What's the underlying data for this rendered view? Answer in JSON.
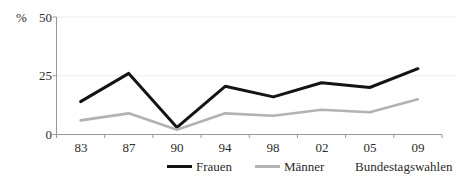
{
  "chart_data": {
    "type": "line",
    "title": "",
    "unit_label": "%",
    "xlabel": "Bundestagswahlen",
    "categories": [
      "83",
      "87",
      "90",
      "94",
      "98",
      "02",
      "05",
      "09"
    ],
    "series": [
      {
        "name": "Frauen",
        "color": "#141414",
        "values": [
          14,
          26,
          3,
          20.5,
          16,
          22,
          20,
          28
        ]
      },
      {
        "name": "Männer",
        "color": "#b2b2b2",
        "values": [
          6,
          9,
          2,
          9,
          8,
          10.5,
          9.5,
          15
        ]
      }
    ],
    "yticks": [
      0,
      25,
      50
    ],
    "ylim": [
      0,
      50
    ],
    "grid": "horizontal",
    "legend_position": "bottom",
    "colors": {
      "axis": "#999999",
      "gridline": "#ececec",
      "text": "#2b2b2b"
    }
  }
}
